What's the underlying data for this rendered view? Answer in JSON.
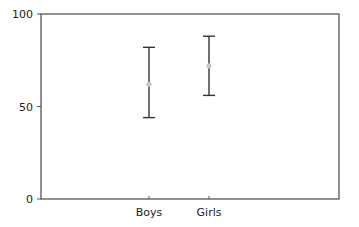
{
  "chart_data": {
    "type": "errorbar",
    "title": "",
    "xlabel": "",
    "ylabel": "",
    "ylim": [
      0,
      100
    ],
    "yticks": [
      0,
      50,
      100
    ],
    "grid": false,
    "legend": null,
    "categories": [
      "Boys",
      "Girls"
    ],
    "series": [
      {
        "name": "mean with error range",
        "means": [
          62,
          72
        ],
        "lower": [
          44,
          56
        ],
        "upper": [
          82,
          88
        ]
      }
    ],
    "colors": {
      "axis": "#555555",
      "errorbar": "#333333",
      "marker": "#c8c8c8"
    }
  },
  "labels": {
    "y_tick_0": "0",
    "y_tick_50": "50",
    "y_tick_100": "100",
    "x_cat_0": "Boys",
    "x_cat_1": "Girls"
  }
}
